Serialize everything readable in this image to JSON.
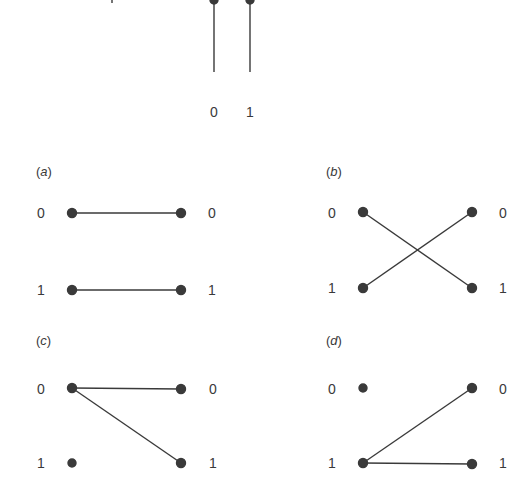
{
  "figure": {
    "top": {
      "description": "Two vertical wires with dots at the top, labelled 0 and 1",
      "wire_labels": [
        "0",
        "1"
      ]
    },
    "panels": [
      {
        "id": "a",
        "label": "(a)",
        "label_letter": "a",
        "left_labels": [
          "0",
          "1"
        ],
        "right_labels": [
          "0",
          "1"
        ],
        "left_dots_connected": [
          true,
          true
        ],
        "edges": [
          [
            "0",
            "0"
          ],
          [
            "1",
            "1"
          ]
        ]
      },
      {
        "id": "b",
        "label": "(b)",
        "label_letter": "b",
        "left_labels": [
          "0",
          "1"
        ],
        "right_labels": [
          "0",
          "1"
        ],
        "edges": [
          [
            "0",
            "1"
          ],
          [
            "1",
            "0"
          ]
        ]
      },
      {
        "id": "c",
        "label": "(c)",
        "label_letter": "c",
        "left_labels": [
          "0",
          "1"
        ],
        "right_labels": [
          "0",
          "1"
        ],
        "edges": [
          [
            "0",
            "0"
          ],
          [
            "0",
            "1"
          ]
        ]
      },
      {
        "id": "d",
        "label": "(d)",
        "label_letter": "d",
        "left_labels": [
          "0",
          "1"
        ],
        "right_labels": [
          "0",
          "1"
        ],
        "edges": [
          [
            "1",
            "0"
          ],
          [
            "1",
            "1"
          ]
        ]
      }
    ],
    "colors": {
      "ink": "#3a3a3a",
      "background": "#ffffff"
    }
  }
}
